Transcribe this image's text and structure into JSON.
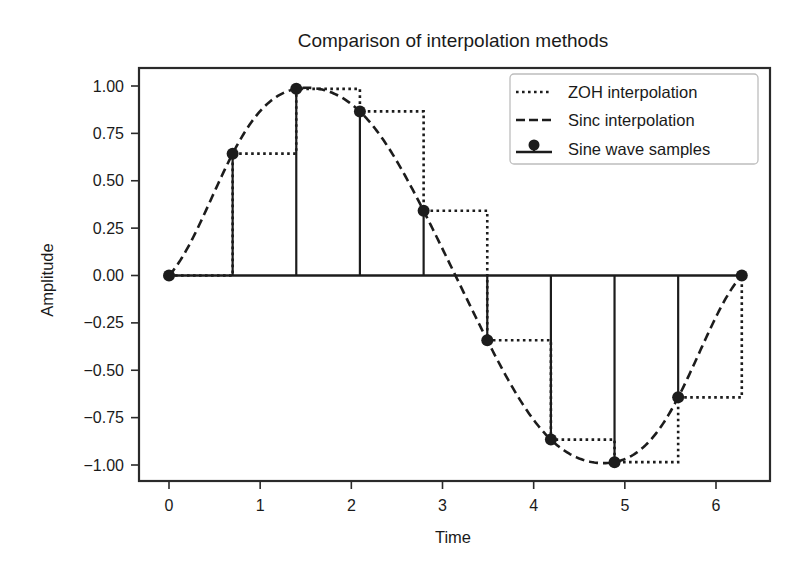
{
  "chart_data": {
    "type": "line",
    "title": "Comparison of interpolation methods",
    "xlabel": "Time",
    "ylabel": "Amplitude",
    "xlim": [
      -0.31,
      6.6
    ],
    "ylim": [
      -1.09,
      1.1
    ],
    "grid": false,
    "legend_position": "upper right",
    "x_ticks": [
      0,
      1,
      2,
      3,
      4,
      5,
      6
    ],
    "x_tick_labels": [
      "0",
      "1",
      "2",
      "3",
      "4",
      "5",
      "6"
    ],
    "y_ticks": [
      1.0,
      0.75,
      0.5,
      0.25,
      0.0,
      -0.25,
      -0.5,
      -0.75,
      -1.0
    ],
    "y_tick_labels": [
      "1.00",
      "0.75",
      "0.50",
      "0.25",
      "0.00",
      "−0.25",
      "−0.50",
      "−0.75",
      "−1.00"
    ],
    "x": [
      0.0,
      0.698,
      1.396,
      2.094,
      2.793,
      3.491,
      4.189,
      4.887,
      5.585,
      6.283
    ],
    "series": [
      {
        "name": "ZOH interpolation",
        "style": "dotted",
        "drawstyle": "steps-post",
        "values": [
          0.0,
          0.643,
          0.985,
          0.866,
          0.342,
          -0.342,
          -0.866,
          -0.985,
          -0.643,
          0.0
        ]
      },
      {
        "name": "Sinc interpolation",
        "style": "dashed",
        "method": "sinc (Whittaker–Shannon) reconstruction of samples",
        "values": [
          0.0,
          0.643,
          0.985,
          0.866,
          0.342,
          -0.342,
          -0.866,
          -0.985,
          -0.643,
          0.0
        ]
      },
      {
        "name": "Sine wave samples",
        "style": "stem",
        "values": [
          0.0,
          0.643,
          0.985,
          0.866,
          0.342,
          -0.342,
          -0.866,
          -0.985,
          -0.643,
          0.0
        ]
      }
    ]
  },
  "legend": {
    "items": [
      {
        "label": "ZOH interpolation",
        "style": "dotted"
      },
      {
        "label": "Sinc interpolation",
        "style": "dashed"
      },
      {
        "label": "Sine wave samples",
        "style": "stem"
      }
    ]
  },
  "colors": {
    "line": "#1c1c1c",
    "frame": "#2a2a2a",
    "legend_border": "#bdbdbd",
    "background": "#ffffff"
  }
}
